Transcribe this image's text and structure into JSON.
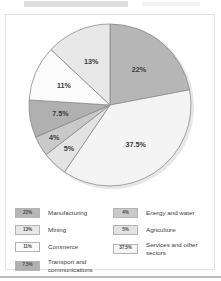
{
  "figure": {
    "background_color": "#ffffff",
    "border_color": "#e2e2e2"
  },
  "chart_data": {
    "type": "pie",
    "title": "",
    "subtitle": "",
    "xlabel": "",
    "ylabel": "",
    "legend_position": "bottom",
    "grid": false,
    "unit": "%",
    "start_angle_deg": 0,
    "direction": "clockwise",
    "categories": [
      "Manufacturing",
      "Services and other sectors",
      "Agriculture",
      "Energy and water",
      "Transport and communications",
      "Commerce",
      "Mining"
    ],
    "values": [
      22,
      37.5,
      5,
      4,
      7.5,
      11,
      13
    ],
    "labels": [
      "22%",
      "37.5%",
      "5%",
      "4%",
      "7.5%",
      "11%",
      "13%"
    ],
    "colors": [
      "#b6b6b6",
      "#f4f4f4",
      "#e3e3e3",
      "#c9c9c9",
      "#b0b0b0",
      "#fbfbfb",
      "#e8e8e8"
    ],
    "slice_border_color": "#8a8a8a",
    "slices": [
      {
        "label": "Manufacturing",
        "value": 22,
        "display": "22%",
        "color": "#b6b6b6"
      },
      {
        "label": "Services and other sectors",
        "value": 37.5,
        "display": "37.5%",
        "color": "#f4f4f4"
      },
      {
        "label": "Agriculture",
        "value": 5,
        "display": "5%",
        "color": "#e3e3e3"
      },
      {
        "label": "Energy and water",
        "value": 4,
        "display": "4%",
        "color": "#c9c9c9"
      },
      {
        "label": "Transport and communications",
        "value": 7.5,
        "display": "7.5%",
        "color": "#b0b0b0"
      },
      {
        "label": "Commerce",
        "value": 11,
        "display": "11%",
        "color": "#fbfbfb"
      },
      {
        "label": "Mining",
        "value": 13,
        "display": "13%",
        "color": "#e8e8e8"
      }
    ]
  },
  "legend": {
    "left_column": [
      {
        "value": "22%",
        "label": "Manufacturing",
        "color": "#b6b6b6"
      },
      {
        "value": "13%",
        "label": "Mining",
        "color": "#e8e8e8"
      },
      {
        "value": "11%",
        "label": "Commerce",
        "color": "#fbfbfb"
      },
      {
        "value": "7.5%",
        "label": "Transport and communications",
        "color": "#b0b0b0"
      }
    ],
    "right_column": [
      {
        "value": "4%",
        "label": "Energy and water",
        "color": "#c9c9c9"
      },
      {
        "value": "5%",
        "label": "Agriculture",
        "color": "#e3e3e3"
      },
      {
        "value": "37.5%",
        "label": "Services and other sectors",
        "color": "#f4f4f4"
      }
    ]
  }
}
